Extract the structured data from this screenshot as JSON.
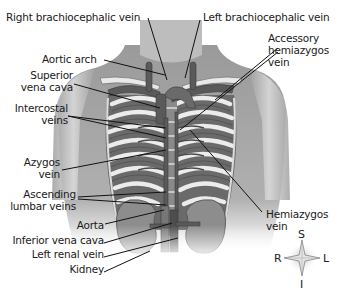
{
  "diagram": {
    "labels": {
      "right_brachiocephalic_vein": "Right brachiocephalic vein",
      "left_brachiocephalic_vein": "Left brachiocephalic vein",
      "aortic_arch": "Aortic arch",
      "accessory_hemiazygos_1": "Accessory",
      "accessory_hemiazygos_2": "hemiazygos",
      "accessory_hemiazygos_3": "vein",
      "superior_vena_cava_1": "Superior",
      "superior_vena_cava_2": "vena cava",
      "intercostal_veins_1": "Intercostal",
      "intercostal_veins_2": "veins",
      "azygos_vein_1": "Azygos",
      "azygos_vein_2": "vein",
      "ascending_lumbar_veins_1": "Ascending",
      "ascending_lumbar_veins_2": "lumbar veins",
      "aorta": "Aorta",
      "inferior_vena_cava": "Inferior vena cava",
      "left_renal_vein": "Left renal vein",
      "kidney": "Kidney",
      "hemiazygos_vein_1": "Hemiazygos",
      "hemiazygos_vein_2": "vein"
    },
    "compass": {
      "superior": "S",
      "inferior": "I",
      "right": "R",
      "left": "L"
    },
    "colors": {
      "skin": "#a9a9a9",
      "skin_light": "#d4d4d4",
      "vein": "#5a5a5a",
      "rib": "#e6e6e6",
      "rib_shadow": "#6f6f6f",
      "kidney": "#8c8c8c",
      "leader_line": "#111111"
    }
  }
}
